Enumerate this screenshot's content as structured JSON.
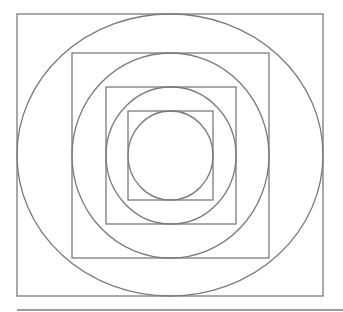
{
  "diagram": {
    "stroke_color": "#7a7a7a",
    "background": "#ffffff",
    "squares": [
      {
        "x": 17,
        "y": 14,
        "w": 306,
        "h": 282
      },
      {
        "x": 72,
        "y": 53,
        "w": 197,
        "h": 205
      },
      {
        "x": 106,
        "y": 87,
        "w": 130,
        "h": 137
      },
      {
        "x": 128,
        "y": 111,
        "w": 85,
        "h": 89
      }
    ],
    "ellipses": [
      {
        "cx": 170,
        "cy": 155,
        "rx": 153,
        "ry": 141
      },
      {
        "cx": 170.5,
        "cy": 155.5,
        "rx": 98.5,
        "ry": 102.5
      },
      {
        "cx": 171,
        "cy": 155.5,
        "rx": 65,
        "ry": 68.5
      },
      {
        "cx": 170.5,
        "cy": 155.5,
        "rx": 42.5,
        "ry": 44.5
      }
    ],
    "baseline": {
      "x1": 17,
      "y1": 310,
      "x2": 343,
      "y2": 310
    }
  }
}
